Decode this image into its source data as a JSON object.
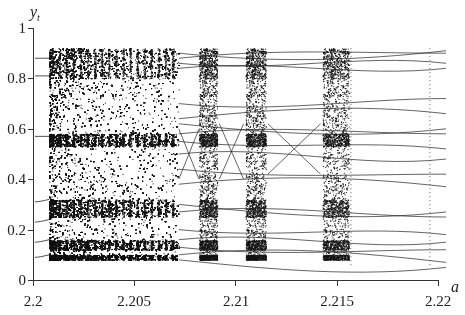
{
  "chart_data": {
    "type": "scatter",
    "title": "",
    "xlabel": "a",
    "ylabel": "y_t",
    "xlim": [
      2.2,
      2.22
    ],
    "ylim": [
      0,
      1
    ],
    "xticks": [
      2.2,
      2.205,
      2.21,
      2.215,
      2.22
    ],
    "xtick_labels": [
      "2.2",
      "2.205",
      "2.21",
      "2.215",
      "2.22"
    ],
    "yticks": [
      0,
      0.2,
      0.4,
      0.6,
      0.8,
      1
    ],
    "ytick_labels": [
      "0",
      "0.2",
      "0.4",
      "0.6",
      "0.8",
      "1"
    ],
    "grid": false,
    "legend": null,
    "chaotic_onset_a": 2.2008,
    "y_range_chaos": [
      0.08,
      0.92
    ],
    "dense_bands_y": [
      [
        0.8,
        0.92
      ],
      [
        0.53,
        0.58
      ],
      [
        0.25,
        0.32
      ],
      [
        0.12,
        0.16
      ],
      [
        0.08,
        0.1
      ]
    ],
    "chaotic_windows_a": [
      [
        2.2082,
        2.2091
      ],
      [
        2.2105,
        2.2115
      ],
      [
        2.2143,
        2.2156
      ]
    ],
    "pre_chaos_branches_y": [
      0.88,
      0.81,
      0.57,
      0.31,
      0.23,
      0.15,
      0.09
    ],
    "periodic_end_branches_y_at_2.22": [
      0.91,
      0.9,
      0.86,
      0.84,
      0.72,
      0.66,
      0.6,
      0.58,
      0.52,
      0.48,
      0.42,
      0.37,
      0.27,
      0.25,
      0.18,
      0.15,
      0.12,
      0.07,
      0.05
    ]
  },
  "axes": {
    "y_name": "y",
    "y_sub": "t",
    "x_name": "a"
  }
}
